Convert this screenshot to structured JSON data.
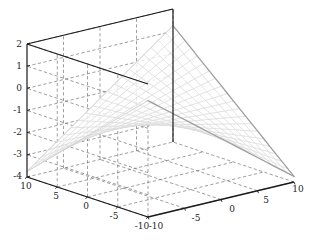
{
  "figure": {
    "background": "#ffffff",
    "type": "surface-mesh-3d",
    "axis_color": "#1a1a1a",
    "grid_color": "#6e6e6e",
    "mesh_color": "#d9d9d9",
    "mesh_edge_dark": "#9e9e9e",
    "width": 319,
    "height": 246
  },
  "chart_data": {
    "type": "surface",
    "title": "",
    "xlabel": "",
    "ylabel": "",
    "zlabel": "",
    "grid": true,
    "legend": null,
    "projection": "3d-mesh-wireframe",
    "view": {
      "azimuth": -37.5,
      "elevation": 22
    },
    "xlim": [
      -10,
      10
    ],
    "ylim": [
      -10,
      10
    ],
    "zlim": [
      -4,
      2
    ],
    "xticks": [
      -10,
      -5,
      0,
      5,
      10
    ],
    "yticks": [
      -10,
      -5,
      0,
      5,
      10
    ],
    "zticks": [
      -4,
      -3,
      -2,
      -1,
      0,
      1,
      2
    ],
    "xticklabels": [
      "-10",
      "-5",
      "0",
      "5",
      "10"
    ],
    "yticklabels": [
      "10",
      "5",
      "0",
      "-5",
      "-10"
    ],
    "zticklabels": [
      "2",
      "1",
      "0",
      "-1",
      "-2",
      "-3",
      "-4"
    ],
    "surface": {
      "description": "saddle-shaped valley mesh, low in center, rising toward +x/+y corner",
      "formula": "z = (x*y)/40 - 1.25",
      "grid_n": 21,
      "z_min": -2.6,
      "z_max": 0.8
    }
  },
  "zaxis": {
    "labels": [
      {
        "text": "2",
        "x": 22,
        "y": 47
      },
      {
        "text": "1",
        "x": 22,
        "y": 69
      },
      {
        "text": "0",
        "x": 22,
        "y": 91
      },
      {
        "text": "-1",
        "x": 22,
        "y": 113
      },
      {
        "text": "-2",
        "x": 22,
        "y": 135
      },
      {
        "text": "-3",
        "x": 22,
        "y": 157
      },
      {
        "text": "-4",
        "x": 22,
        "y": 179
      }
    ]
  },
  "yaxis": {
    "labels": [
      {
        "text": "10",
        "x": 26,
        "y": 189
      },
      {
        "text": "5",
        "x": 56,
        "y": 199
      },
      {
        "text": "0",
        "x": 86,
        "y": 209
      },
      {
        "text": "-5",
        "x": 114,
        "y": 219
      },
      {
        "text": "-10",
        "x": 142,
        "y": 229
      }
    ]
  },
  "xaxis": {
    "labels": [
      {
        "text": "-10",
        "x": 156,
        "y": 229
      },
      {
        "text": "-5",
        "x": 196,
        "y": 221
      },
      {
        "text": "0",
        "x": 232,
        "y": 212
      },
      {
        "text": "5",
        "x": 266,
        "y": 203
      },
      {
        "text": "10",
        "x": 298,
        "y": 192
      }
    ]
  }
}
